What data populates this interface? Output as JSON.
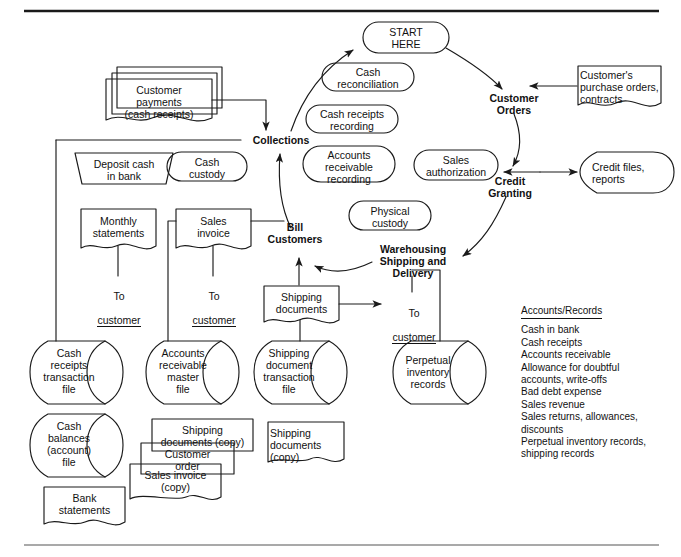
{
  "figure": {
    "title_rules": {
      "top_rule": true,
      "bottom_rule": true
    },
    "domain": "accounting-revenue-cycle-flowchart"
  },
  "cycle": {
    "start": "START\nHERE",
    "nodes": [
      {
        "id": "customer-orders",
        "label": "Customer\nOrders"
      },
      {
        "id": "credit-granting",
        "label": "Credit\nGranting"
      },
      {
        "id": "warehousing-shipping-delivery",
        "label": "Warehousing\nShipping and\nDelivery"
      },
      {
        "id": "bill-customers",
        "label": "Bill\nCustomers"
      },
      {
        "id": "collections",
        "label": "Collections"
      }
    ]
  },
  "functions": [
    {
      "id": "cash-reconciliation",
      "label": "Cash\nreconciliation"
    },
    {
      "id": "cash-receipts-recording",
      "label": "Cash receipts\nrecording"
    },
    {
      "id": "accounts-receivable-recording",
      "label": "Accounts\nreceivable\nrecording"
    },
    {
      "id": "sales-authorization",
      "label": "Sales\nauthorization"
    },
    {
      "id": "physical-custody",
      "label": "Physical\ncustody"
    },
    {
      "id": "cash-custody",
      "label": "Cash\ncustody"
    }
  ],
  "documents": {
    "customer_payments": "Customer\npayments\n(cash receipts)",
    "customers_purchase_orders": "Customer's\npurchase orders,\ncontracts",
    "monthly_statements": "Monthly\nstatements",
    "sales_invoice": "Sales\ninvoice",
    "shipping_documents": "Shipping\ndocuments",
    "shipping_documents_copy_mid": "Shipping\ndocuments (copy)",
    "customer_order_copy": "Customer\norder",
    "sales_invoice_copy": "Sales invoice\n(copy)",
    "shipping_documents_copy_right": "Shipping\ndocuments\n(copy)",
    "bank_statements": "Bank\nstatements"
  },
  "manual_ops": {
    "deposit_cash_in_bank": "Deposit cash\nin bank"
  },
  "files": {
    "credit_files_reports": "Credit files,\nreports",
    "cash_receipts_transaction_file": "Cash\nreceipts\ntransaction\nfile",
    "cash_balances_account_file": "Cash\nbalances\n(account)\nfile",
    "accounts_receivable_master_file": "Accounts\nreceivable\nmaster\nfile",
    "shipping_document_transaction_file": "Shipping\ndocument\ntransaction\nfile",
    "perpetual_inventory_records": "Perpetual\ninventory\nrecords"
  },
  "destinations": {
    "to_customer_1": {
      "line1": "To",
      "line2": "customer"
    },
    "to_customer_2": {
      "line1": "To",
      "line2": "customer"
    },
    "to_customer_3": {
      "line1": "To",
      "line2": "customer"
    }
  },
  "accounts_records": {
    "title": "Accounts/Records",
    "items": [
      "Cash in bank",
      "Cash receipts",
      "Accounts receivable",
      "Allowance for doubtful\n   accounts, write-offs",
      "Bad debt expense",
      "Sales revenue",
      "Sales returns, allowances,\n   discounts",
      "Perpetual inventory records,\n   shipping records"
    ]
  },
  "colors": {
    "stroke": "#1a1a1a",
    "text": "#111111",
    "background": "#ffffff"
  }
}
